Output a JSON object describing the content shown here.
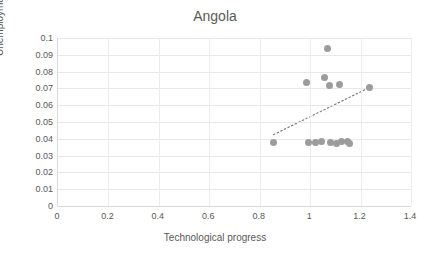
{
  "chart_data": {
    "type": "scatter",
    "title": "Angola",
    "xlabel": "Technological progress",
    "ylabel": "Unemployment rate",
    "xlim": [
      0,
      1.4
    ],
    "ylim": [
      0,
      0.1
    ],
    "xticks": [
      "0",
      "0.2",
      "0.4",
      "0.6",
      "0.8",
      "1",
      "1.2",
      "1.4"
    ],
    "xtick_values": [
      0,
      0.2,
      0.4,
      0.6,
      0.8,
      1,
      1.2,
      1.4
    ],
    "yticks": [
      "0",
      "0.01",
      "0.02",
      "0.03",
      "0.04",
      "0.05",
      "0.06",
      "0.07",
      "0.08",
      "0.09",
      "0.1"
    ],
    "ytick_values": [
      0,
      0.01,
      0.02,
      0.03,
      0.04,
      0.05,
      0.06,
      0.07,
      0.08,
      0.09,
      0.1
    ],
    "grid": true,
    "legend": null,
    "marker_color": "#9c9c9c",
    "trendline": {
      "style": "dotted",
      "color": "#808080",
      "x": [
        0.855,
        1.235
      ],
      "y": [
        0.0425,
        0.0705
      ]
    },
    "points": [
      {
        "x": 0.855,
        "y": 0.038
      },
      {
        "x": 0.985,
        "y": 0.0735
      },
      {
        "x": 0.995,
        "y": 0.038
      },
      {
        "x": 1.02,
        "y": 0.038
      },
      {
        "x": 1.045,
        "y": 0.0385
      },
      {
        "x": 1.055,
        "y": 0.0765
      },
      {
        "x": 1.07,
        "y": 0.0935
      },
      {
        "x": 1.075,
        "y": 0.0715
      },
      {
        "x": 1.08,
        "y": 0.038
      },
      {
        "x": 1.105,
        "y": 0.0375
      },
      {
        "x": 1.115,
        "y": 0.0725
      },
      {
        "x": 1.125,
        "y": 0.0385
      },
      {
        "x": 1.15,
        "y": 0.0385
      },
      {
        "x": 1.155,
        "y": 0.0375
      },
      {
        "x": 1.235,
        "y": 0.0705
      }
    ]
  }
}
